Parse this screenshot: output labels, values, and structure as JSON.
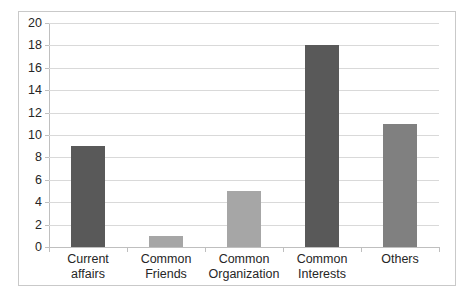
{
  "chart_data": {
    "type": "bar",
    "title": "",
    "subtitle": "",
    "xlabel": "",
    "ylabel": "",
    "categories": [
      "Current affairs",
      "Common Friends",
      "Common Organization",
      "Common Interests",
      "Others"
    ],
    "category_lines": [
      [
        "Current affairs"
      ],
      [
        "Common",
        "Friends"
      ],
      [
        "Common",
        "Organization"
      ],
      [
        "Common",
        "Interests"
      ],
      [
        "Others"
      ]
    ],
    "values": [
      9,
      1,
      5,
      18,
      11
    ],
    "bar_colors": [
      "#595959",
      "#a6a6a6",
      "#a6a6a6",
      "#595959",
      "#808080"
    ],
    "ylim": [
      0,
      20
    ],
    "ytick_step": 2,
    "yticks": [
      20,
      18,
      16,
      14,
      12,
      10,
      8,
      6,
      4,
      2,
      0
    ],
    "ytick_labels": [
      "20",
      "18",
      "16",
      "14",
      "12",
      "10",
      "8",
      "6",
      "4",
      "2",
      "0"
    ],
    "grid": true,
    "gridline_color": "#d9d9d9",
    "axis_color": "#bfbfbf",
    "legend": false,
    "legend_position": "none",
    "plot_background": "#ffffff",
    "border_color": "#c9c9c9",
    "text_color": "#262626",
    "annotations": []
  }
}
